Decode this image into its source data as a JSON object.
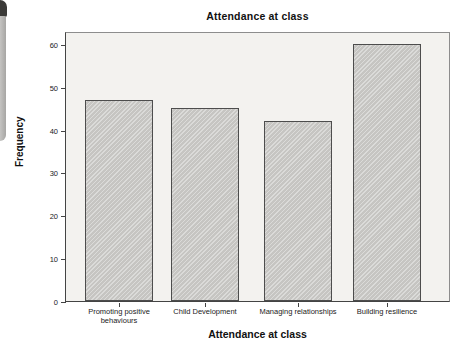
{
  "artifact": {
    "cap_color": "#3b3a38",
    "body_color_light": "#c4c3c1",
    "body_color_dark": "#a7a6a4"
  },
  "chart_data": {
    "type": "bar",
    "title": "Attendance at class",
    "xlabel": "Attendance at class",
    "ylabel": "Frequency",
    "categories": [
      "Promoting positive behaviours",
      "Child Development",
      "Managing relationships",
      "Building resilience"
    ],
    "values": [
      47,
      45,
      42,
      60
    ],
    "yticks": [
      0,
      10,
      20,
      30,
      40,
      50,
      60
    ],
    "ylim": [
      0,
      63
    ],
    "grid": false,
    "legend": "none",
    "plot_background": "#f3f2ef",
    "frame_border": "#8d8d8d",
    "axis_color": "#444444",
    "bar_fill": "#cccbc8",
    "bar_border": "#4d4d4d"
  }
}
